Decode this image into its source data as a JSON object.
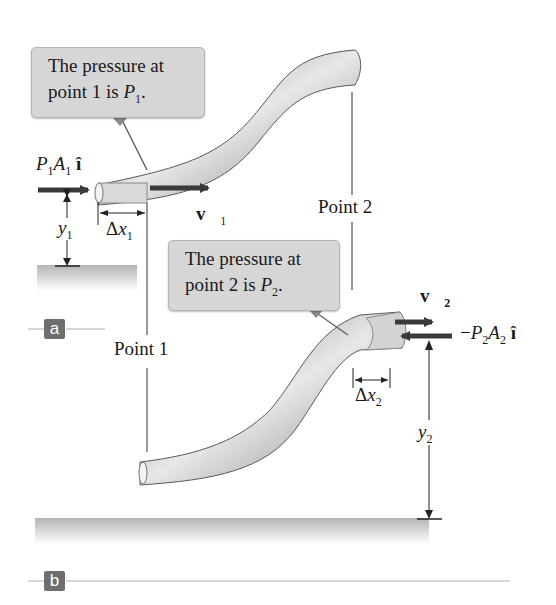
{
  "figure": {
    "panel_a": {
      "badge": "a",
      "callout": {
        "text_line1": "The pressure at",
        "text_line2_prefix": "point 1 is ",
        "symbol": "P",
        "subscript": "1",
        "suffix": "."
      },
      "force_label": {
        "P": "P",
        "P_sub": "1",
        "A": "A",
        "A_sub": "1",
        "unit_vector": "î"
      },
      "velocity_label": {
        "symbol": "v⃗",
        "subscript": "1"
      },
      "displacement_label": {
        "prefix": "Δ",
        "symbol": "x",
        "subscript": "1"
      },
      "height_label": {
        "symbol": "y",
        "subscript": "1"
      },
      "point_label": "Point 1"
    },
    "panel_b": {
      "badge": "b",
      "callout": {
        "text_line1": "The pressure at",
        "text_line2_prefix": "point 2 is ",
        "symbol": "P",
        "subscript": "2",
        "suffix": "."
      },
      "force_label": {
        "sign": "−",
        "P": "P",
        "P_sub": "2",
        "A": "A",
        "A_sub": "2",
        "unit_vector": "î"
      },
      "velocity_label": {
        "symbol": "v⃗",
        "subscript": "2"
      },
      "displacement_label": {
        "prefix": "Δ",
        "symbol": "x",
        "subscript": "2"
      },
      "height_label": {
        "symbol": "y",
        "subscript": "2"
      },
      "point_label": "Point 2"
    },
    "colors": {
      "arrow": "#3a3a3a",
      "callout_bg": "#d6d6d6",
      "badge_bg": "#6e6e6e",
      "ground": "#bdbdbd",
      "pipe_dark": "#8a8a8a",
      "pipe_light": "#e6e6e6",
      "panel_rule": "#c8c8c8"
    }
  }
}
